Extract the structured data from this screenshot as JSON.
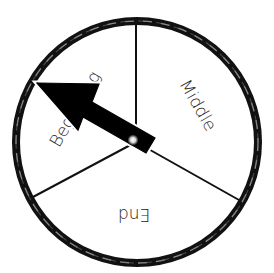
{
  "diagram": {
    "type": "spinner-wheel",
    "sections": [
      {
        "label": "Beginning",
        "position": "left"
      },
      {
        "label": "Middle",
        "position": "right"
      },
      {
        "label": "End",
        "position": "bottom"
      }
    ],
    "pointer": {
      "points_to": "Beginning"
    },
    "colors": {
      "rim": "#111111",
      "rim_wave": "#9a9a9a",
      "arrow": "#000000",
      "background": "#ffffff"
    }
  }
}
